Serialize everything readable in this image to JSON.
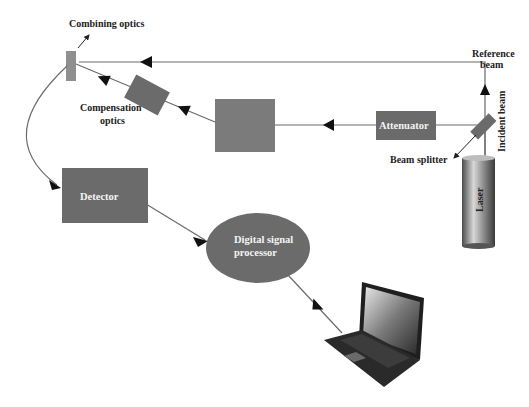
{
  "diagram": {
    "labels": {
      "combining_optics": "Combining optics",
      "compensation_optics_line1": "Compensation",
      "compensation_optics_line2": "optics",
      "reference_beam_line1": "Reference",
      "reference_beam_line2": "beam",
      "incident_beam": "Incident beam",
      "beam_splitter": "Beam splitter",
      "attenuator": "Attenuator",
      "laser": "Laser",
      "detector": "Detector",
      "dsp_line1": "Digital signal",
      "dsp_line2": "processor"
    },
    "colors": {
      "component_fill": "#6b6b6b",
      "component_fill_light": "#8a8a8a",
      "beam_line": "#6a6a6a",
      "arrow": "#111111",
      "laser_light": "#d8d8d8",
      "laser_dark": "#3a3a3a"
    },
    "icons": {
      "computer": "laptop-icon"
    }
  }
}
